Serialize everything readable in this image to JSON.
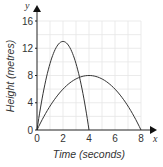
{
  "chart_data": {
    "type": "line",
    "title": "",
    "xlabel": "Time (seconds)",
    "ylabel": "Height (metres)",
    "x_axis_letter": "x",
    "y_axis_letter": "y",
    "xlim": [
      0,
      8
    ],
    "ylim": [
      0,
      16
    ],
    "x_ticks": [
      0,
      2,
      4,
      6,
      8
    ],
    "y_ticks": [
      0,
      4,
      8,
      12,
      16
    ],
    "grid": true,
    "grid_x_step": 1,
    "grid_y_step": 2,
    "legend": null,
    "series": [
      {
        "name": "curve-1",
        "x": [
          0,
          0.5,
          1,
          1.5,
          2,
          2.5,
          3,
          3.5,
          4
        ],
        "y": [
          0,
          5.7,
          9.75,
          12.2,
          13,
          12.2,
          9.75,
          5.7,
          0
        ],
        "peak": [
          2,
          13
        ],
        "color": "#333333"
      },
      {
        "name": "curve-2",
        "x": [
          0,
          1,
          2,
          3,
          4,
          5,
          6,
          7,
          8
        ],
        "y": [
          0,
          3.5,
          6,
          7.5,
          8,
          7.5,
          6,
          3.5,
          0
        ],
        "peak": [
          4,
          8
        ],
        "color": "#333333"
      }
    ]
  },
  "colors": {
    "axis": "#222222",
    "grid": "#e6e6e6",
    "curve": "#333333"
  }
}
